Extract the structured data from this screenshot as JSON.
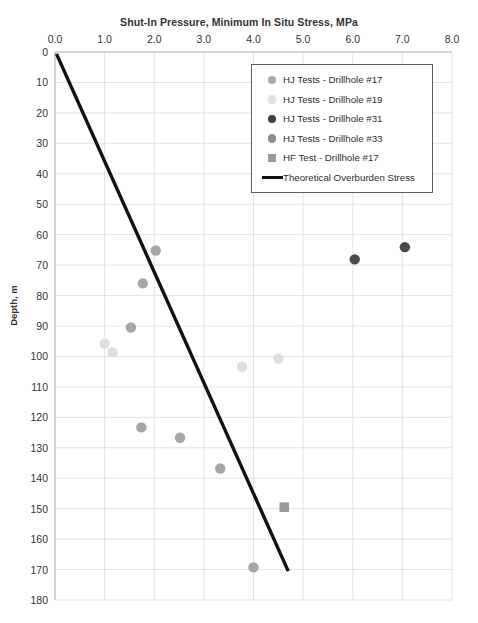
{
  "chart_data": {
    "type": "scatter",
    "title": "",
    "xlabel": "Shut-In Pressure, Minimum In Situ Stress, MPa",
    "ylabel": "Depth, m",
    "xlim": [
      0.0,
      8.0
    ],
    "ylim": [
      0,
      180
    ],
    "y_inverted": true,
    "grid": true,
    "xticks": [
      "0.0",
      "1.0",
      "2.0",
      "3.0",
      "4.0",
      "5.0",
      "6.0",
      "7.0",
      "8.0"
    ],
    "xtick_values": [
      0.0,
      1.0,
      2.0,
      3.0,
      4.0,
      5.0,
      6.0,
      7.0,
      8.0
    ],
    "yticks": [
      "0",
      "10",
      "20",
      "30",
      "40",
      "50",
      "60",
      "70",
      "80",
      "90",
      "100",
      "110",
      "120",
      "130",
      "140",
      "150",
      "160",
      "170",
      "180"
    ],
    "ytick_values": [
      0,
      10,
      20,
      30,
      40,
      50,
      60,
      70,
      80,
      90,
      100,
      110,
      120,
      130,
      140,
      150,
      160,
      170,
      180
    ],
    "legend_position": "upper-right",
    "series": [
      {
        "name": "HJ Tests - Drillhole #17",
        "marker": "circle",
        "color": "#a6a6a6",
        "points": [
          {
            "x": 2.03,
            "y": 65.2
          },
          {
            "x": 1.77,
            "y": 76.0
          },
          {
            "x": 1.53,
            "y": 90.5
          },
          {
            "x": 1.74,
            "y": 123.3
          },
          {
            "x": 2.52,
            "y": 126.7
          },
          {
            "x": 3.33,
            "y": 136.8
          },
          {
            "x": 4.0,
            "y": 169.3
          }
        ]
      },
      {
        "name": "HJ Tests - Drillhole #19",
        "marker": "circle",
        "color": "#dedede",
        "points": [
          {
            "x": 1.0,
            "y": 95.8
          },
          {
            "x": 1.16,
            "y": 98.6
          },
          {
            "x": 3.77,
            "y": 103.4
          },
          {
            "x": 4.5,
            "y": 100.7
          }
        ]
      },
      {
        "name": "HJ Tests - Drillhole #31",
        "marker": "circle",
        "color": "#4a4a4a",
        "points": [
          {
            "x": 6.04,
            "y": 68.1
          },
          {
            "x": 7.05,
            "y": 64.1
          }
        ]
      },
      {
        "name": "HJ Tests - Drillhole #33",
        "marker": "circle",
        "color": "#8f8f8f",
        "points": []
      },
      {
        "name": "HF Test - Drillhole #17",
        "marker": "square",
        "color": "#9a9a9a",
        "points": [
          {
            "x": 4.62,
            "y": 149.5
          }
        ]
      },
      {
        "name": "Theoretical Overburden Stress",
        "marker": "line",
        "color": "#111111",
        "line": [
          {
            "x": 0.03,
            "y": 0.6
          },
          {
            "x": 4.7,
            "y": 170.5
          }
        ]
      }
    ]
  },
  "legend": {
    "items": [
      {
        "label": "HJ Tests - Drillhole #17",
        "swatch": "circle",
        "color": "#a6a6a6"
      },
      {
        "label": "HJ Tests - Drillhole #19",
        "swatch": "circle",
        "color": "#e2e2e2"
      },
      {
        "label": "HJ Tests - Drillhole #31",
        "swatch": "circle",
        "color": "#404040"
      },
      {
        "label": "HJ Tests - Drillhole #33",
        "swatch": "circle",
        "color": "#8f8f8f"
      },
      {
        "label": "HF Test - Drillhole #17",
        "swatch": "square",
        "color": "#9a9a9a"
      },
      {
        "label": "Theoretical Overburden Stress",
        "swatch": "line",
        "color": "#111111"
      }
    ]
  },
  "caption": {
    "text": ""
  }
}
